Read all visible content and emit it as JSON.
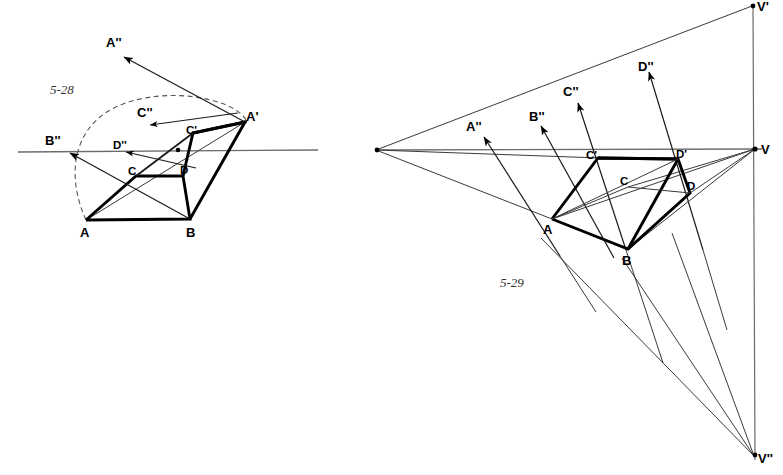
{
  "page": {
    "background_color": "#ffffff",
    "width": 783,
    "height": 475
  },
  "figures": [
    {
      "id": "fig-5-28",
      "number": "5-28",
      "number_pos": {
        "x": 50,
        "y": 94
      },
      "description": "Perspective rotation construction with dashed arc",
      "horizon": {
        "x1": 18,
        "y1": 152,
        "x2": 318,
        "y2": 150
      },
      "center_dot": {
        "x": 178,
        "y": 150
      },
      "points": {
        "A": {
          "x": 86,
          "y": 220,
          "label": "A",
          "lx": 80,
          "ly": 237
        },
        "B": {
          "x": 190,
          "y": 219,
          "label": "B",
          "lx": 186,
          "ly": 237
        },
        "C": {
          "x": 136,
          "y": 176,
          "label": "C",
          "lx": 128,
          "ly": 173
        },
        "D": {
          "x": 183,
          "y": 176,
          "label": "D",
          "lx": 182,
          "ly": 174
        },
        "Ap": {
          "x": 245,
          "y": 122,
          "label": "A'",
          "lx": 246,
          "ly": 121
        },
        "Cp": {
          "x": 193,
          "y": 133,
          "label": "C'",
          "lx": 188,
          "ly": 133
        },
        "App": {
          "x": 122,
          "y": 55,
          "label": "A''",
          "lx": 107,
          "ly": 47
        },
        "Bpp": {
          "x": 68,
          "y": 152,
          "label": "B''",
          "lx": 46,
          "ly": 144
        },
        "Cpp": {
          "x": 148,
          "y": 124,
          "label": "C''",
          "lx": 139,
          "ly": 116
        },
        "Dpp": {
          "x": 124,
          "y": 151,
          "label": "D''",
          "lx": 114,
          "ly": 148
        }
      }
    },
    {
      "id": "fig-5-29",
      "number": "5-29",
      "number_pos": {
        "x": 500,
        "y": 287
      },
      "description": "Two-point perspective with vanishing points V, V-prime, V-double-prime",
      "horizon": {
        "x1": 376,
        "y1": 150,
        "x2": 760,
        "y2": 149
      },
      "vertical": {
        "x": 753,
        "y1": 5,
        "y2": 462
      },
      "points": {
        "A": {
          "x": 552,
          "y": 219,
          "label": "A",
          "lx": 543,
          "ly": 233
        },
        "B": {
          "x": 628,
          "y": 249,
          "label": "B",
          "lx": 622,
          "ly": 264
        },
        "C": {
          "x": 628,
          "y": 187,
          "label": "C",
          "lx": 621,
          "ly": 184
        },
        "D": {
          "x": 690,
          "y": 193,
          "label": "D",
          "lx": 688,
          "ly": 190
        },
        "Cp": {
          "x": 598,
          "y": 158,
          "label": "C'",
          "lx": 589,
          "ly": 158
        },
        "Dp": {
          "x": 678,
          "y": 159,
          "label": "D'",
          "lx": 677,
          "ly": 158
        },
        "VL": {
          "x": 376,
          "y": 150,
          "label": "",
          "lx": 0,
          "ly": 0
        },
        "V": {
          "x": 755,
          "y": 149,
          "label": "V",
          "lx": 761,
          "ly": 154
        },
        "Vp": {
          "x": 753,
          "y": 5,
          "label": "V'",
          "lx": 758,
          "ly": 10
        },
        "Vpp": {
          "x": 755,
          "y": 455,
          "label": "V''",
          "lx": 759,
          "ly": 462
        },
        "App": {
          "x": 483,
          "y": 139,
          "label": "A''",
          "lx": 467,
          "ly": 131
        },
        "Bpp": {
          "x": 540,
          "y": 128,
          "label": "B''",
          "lx": 530,
          "ly": 120
        },
        "Cpp": {
          "x": 576,
          "y": 104,
          "label": "C''",
          "lx": 564,
          "ly": 95
        },
        "Dpp": {
          "x": 647,
          "y": 73,
          "label": "D''",
          "lx": 640,
          "ly": 70
        }
      }
    }
  ],
  "labels": {
    "A": "A",
    "B": "B",
    "C": "C",
    "D": "D",
    "A_prime": "A'",
    "C_prime": "C'",
    "D_prime": "D'",
    "A_dprime": "A''",
    "B_dprime": "B''",
    "C_dprime": "C''",
    "D_dprime": "D''",
    "V": "V",
    "V_prime": "V'",
    "V_dprime": "V''",
    "fig_left": "5-28",
    "fig_right": "5-29"
  },
  "colors": {
    "ink": "#000000",
    "thin_line": "#3a3a3a",
    "horizon": "#6b6b6b",
    "dashed": "#555555",
    "paper": "#ffffff"
  }
}
